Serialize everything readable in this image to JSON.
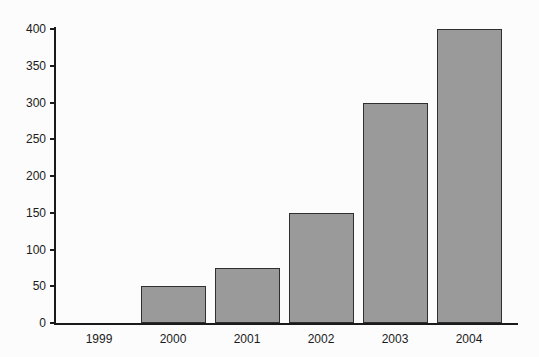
{
  "chart_data": {
    "type": "bar",
    "categories": [
      "1999",
      "2000",
      "2001",
      "2002",
      "2003",
      "2004"
    ],
    "values": [
      0,
      50,
      75,
      150,
      300,
      400
    ],
    "title": "",
    "xlabel": "",
    "ylabel": "",
    "ylim": [
      0,
      400
    ],
    "yticks": [
      0,
      50,
      100,
      150,
      200,
      250,
      300,
      350,
      400
    ],
    "grid": false,
    "legend": "none",
    "colors": {
      "bar_fill": "#9a9a9a",
      "bar_border": "#2f2f2f",
      "axis": "#1a1a1a",
      "text": "#1b1b1b",
      "background": "#fcfcfc"
    }
  }
}
